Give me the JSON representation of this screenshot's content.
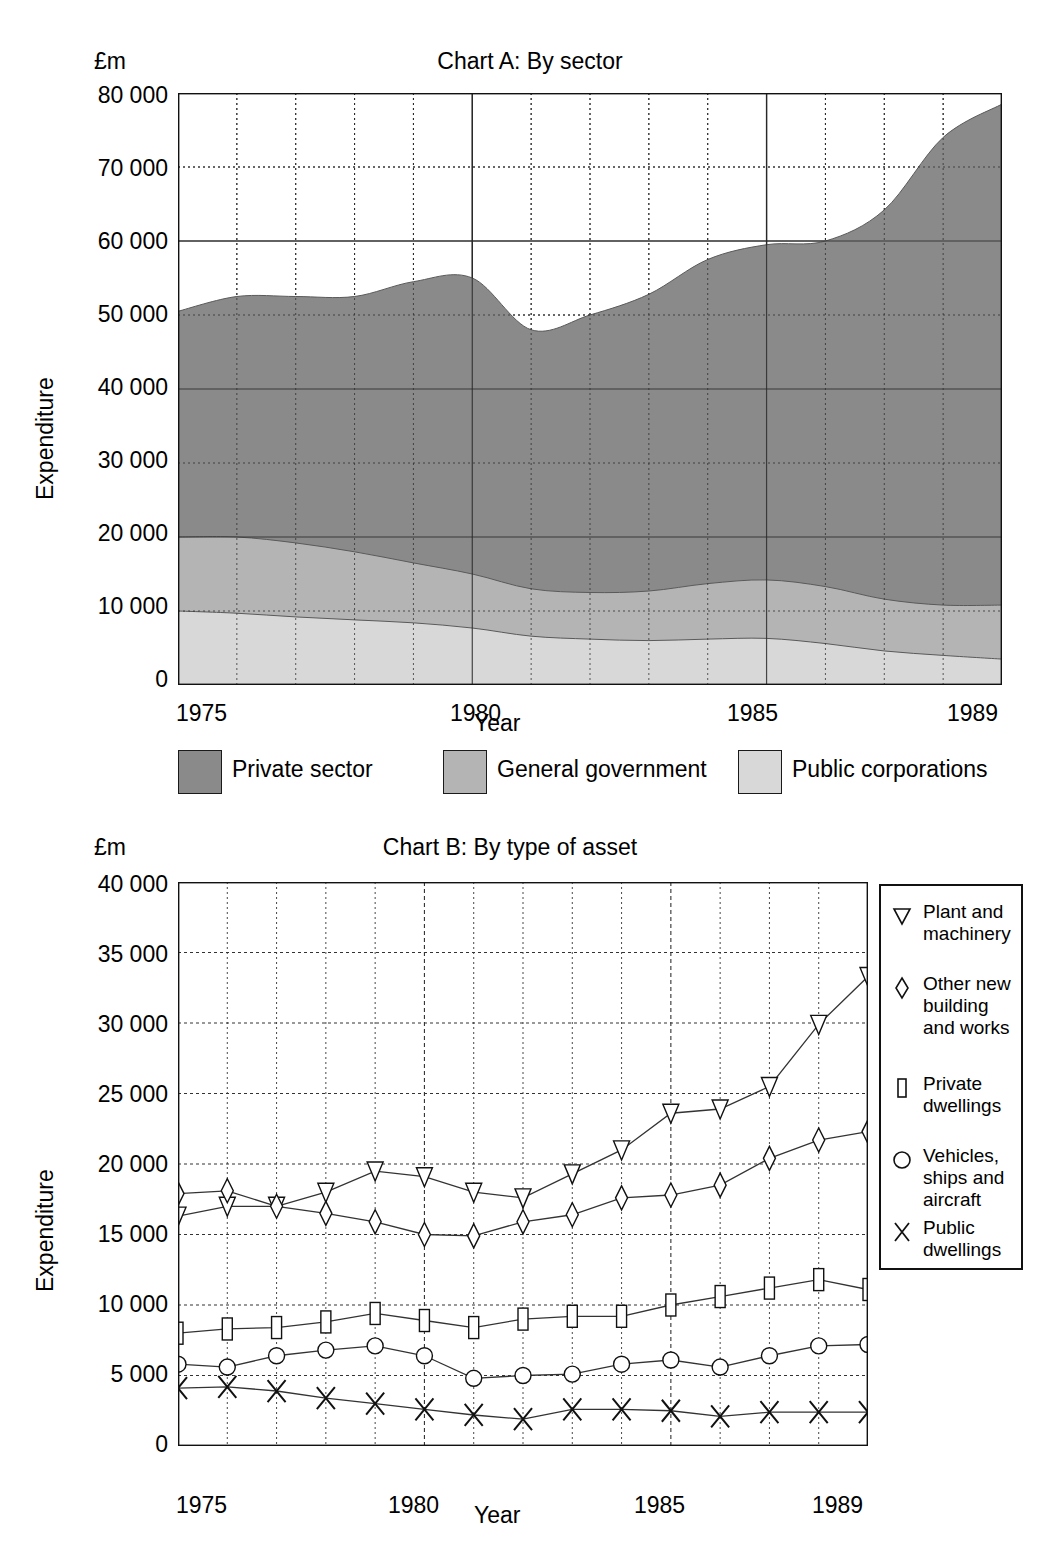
{
  "page": {
    "unit_label": "£m",
    "x_axis_title": "Year",
    "y_axis_title": "Expenditure"
  },
  "chartA": {
    "title": "Chart A: By sector",
    "unit_label": "£m",
    "x_axis_title": "Year",
    "y_axis_title": "Expenditure",
    "yticks": [
      "80 000",
      "70 000",
      "60 000",
      "50 000",
      "40 000",
      "30 000",
      "20 000",
      "10 000",
      "0"
    ],
    "xticks": [
      "1975",
      "1980",
      "1985",
      "1989"
    ],
    "legend": [
      {
        "label": "Private sector",
        "color": "#8a8a8a"
      },
      {
        "label": "General government",
        "color": "#b4b4b4"
      },
      {
        "label": "Public corporations",
        "color": "#d8d8d8"
      }
    ]
  },
  "chartB": {
    "title": "Chart B: By type of asset",
    "unit_label": "£m",
    "x_axis_title": "Year",
    "y_axis_title": "Expenditure",
    "yticks": [
      "40 000",
      "35 000",
      "30 000",
      "25 000",
      "20 000",
      "15 000",
      "10 000",
      "5 000",
      "0"
    ],
    "xticks": [
      "1975",
      "1980",
      "1985",
      "1989"
    ],
    "legend": [
      {
        "label": "Plant and\nmachinery",
        "marker": "triangle-down-marker"
      },
      {
        "label": "Other new\nbuilding\nand works",
        "marker": "diamond-marker"
      },
      {
        "label": "Private\ndwellings",
        "marker": "rect-marker"
      },
      {
        "label": "Vehicles,\nships and\naircraft",
        "marker": "circle-marker"
      },
      {
        "label": "Public\ndwellings",
        "marker": "cross-marker"
      }
    ]
  },
  "chart_data": [
    {
      "type": "area",
      "id": "chart-a",
      "title": "Chart A: By sector",
      "xlabel": "Year",
      "ylabel": "Expenditure",
      "unit": "£m",
      "stacked": true,
      "grid": true,
      "legend_position": "below",
      "xlim": [
        1975,
        1989
      ],
      "ylim": [
        0,
        80000
      ],
      "x": [
        1975,
        1976,
        1977,
        1978,
        1979,
        1980,
        1981,
        1982,
        1983,
        1984,
        1985,
        1986,
        1987,
        1988,
        1989
      ],
      "xtick_labels": [
        "1975",
        "1980",
        "1985",
        "1989"
      ],
      "ytick_labels": [
        "0",
        "10 000",
        "20 000",
        "30 000",
        "40 000",
        "50 000",
        "60 000",
        "70 000",
        "80 000"
      ],
      "series": [
        {
          "name": "Public corporations",
          "color": "#d8d8d8",
          "values": [
            10000,
            9700,
            9200,
            8800,
            8400,
            7700,
            6600,
            6200,
            6000,
            6200,
            6300,
            5600,
            4600,
            4000,
            3500
          ]
        },
        {
          "name": "General government",
          "color": "#b4b4b4",
          "values": [
            10000,
            10300,
            10000,
            9200,
            8100,
            7300,
            6400,
            6300,
            6700,
            7500,
            7900,
            7700,
            7000,
            6800,
            7300
          ]
        },
        {
          "name": "Private sector",
          "color": "#8a8a8a",
          "values": [
            30500,
            32500,
            33300,
            34500,
            38000,
            40000,
            35000,
            37500,
            40100,
            43800,
            45300,
            46700,
            52600,
            63200,
            67700
          ]
        }
      ],
      "totals": [
        50500,
        52500,
        52500,
        52500,
        54500,
        55000,
        48000,
        50000,
        52800,
        57500,
        59500,
        60000,
        64200,
        74000,
        78500
      ]
    },
    {
      "type": "line",
      "id": "chart-b",
      "title": "Chart B: By type of asset",
      "xlabel": "Year",
      "ylabel": "Expenditure",
      "unit": "£m",
      "grid": true,
      "legend_position": "right",
      "xlim": [
        1975,
        1989
      ],
      "ylim": [
        0,
        40000
      ],
      "x": [
        1975,
        1976,
        1977,
        1978,
        1979,
        1980,
        1981,
        1982,
        1983,
        1984,
        1985,
        1986,
        1987,
        1988,
        1989
      ],
      "xtick_labels": [
        "1975",
        "1980",
        "1985",
        "1989"
      ],
      "ytick_labels": [
        "0",
        "5 000",
        "10 000",
        "15 000",
        "20 000",
        "25 000",
        "30 000",
        "35 000",
        "40 000"
      ],
      "series": [
        {
          "name": "Plant and machinery",
          "marker": "triangle-down",
          "values": [
            16300,
            17000,
            17000,
            18000,
            19500,
            19100,
            18000,
            17600,
            19300,
            21000,
            23600,
            23900,
            25500,
            29900,
            33300
          ]
        },
        {
          "name": "Other new building and works",
          "marker": "diamond",
          "values": [
            17900,
            18100,
            17000,
            16500,
            15900,
            15000,
            14900,
            15900,
            16400,
            17600,
            17800,
            18500,
            20400,
            21700,
            22300
          ]
        },
        {
          "name": "Private dwellings",
          "marker": "rect",
          "values": [
            8000,
            8300,
            8400,
            8800,
            9400,
            8900,
            8400,
            9000,
            9200,
            9200,
            10000,
            10600,
            11200,
            11800,
            11100
          ]
        },
        {
          "name": "Vehicles, ships and aircraft",
          "marker": "circle",
          "values": [
            5800,
            5600,
            6400,
            6800,
            7100,
            6400,
            4800,
            5000,
            5100,
            5800,
            6100,
            5600,
            6400,
            7100,
            7200
          ]
        },
        {
          "name": "Public dwellings",
          "marker": "cross",
          "values": [
            4100,
            4200,
            3900,
            3400,
            3000,
            2600,
            2200,
            1900,
            2600,
            2600,
            2500,
            2100,
            2400,
            2400,
            2400
          ]
        }
      ]
    }
  ]
}
